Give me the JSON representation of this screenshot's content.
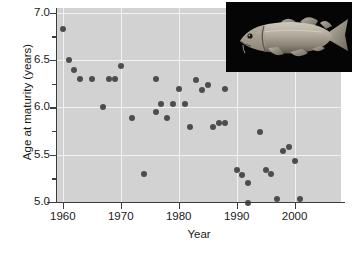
{
  "figure": {
    "background_color": "#ffffff",
    "panel_color": "#d2d2d2",
    "grid_color": "#f2f2f2",
    "marker_color": "#4d4d4d",
    "axis_color": "#3d3d3d"
  },
  "inset": {
    "name": "atlantic-cod-photograph",
    "background_color": "#050505",
    "subject": "cod-fish"
  },
  "chart_data": {
    "type": "scatter",
    "title": "",
    "xlabel": "Year",
    "ylabel": "Age at maturity (years)",
    "xlim": [
      1959,
      2008
    ],
    "ylim": [
      5.0,
      7.05
    ],
    "xticks": [
      1960,
      1970,
      1980,
      1990,
      2000
    ],
    "xticklabels": [
      "1960",
      "1970",
      "1980",
      "1990",
      "2000"
    ],
    "yticks": [
      5.0,
      5.5,
      6.0,
      6.5,
      7.0
    ],
    "yticklabels": [
      "5.0",
      "5.5",
      "6.0",
      "6.5",
      "7.0"
    ],
    "yminorticks": [
      5.25,
      5.75,
      6.25,
      6.75
    ],
    "grid": true,
    "grid_axis": "both",
    "legend": null,
    "series": [
      {
        "name": "Age at maturity",
        "marker": "circle",
        "color": "#4d4d4d",
        "points": [
          {
            "x": 1960,
            "y": 6.83
          },
          {
            "x": 1961,
            "y": 6.5
          },
          {
            "x": 1962,
            "y": 6.4
          },
          {
            "x": 1963,
            "y": 6.3
          },
          {
            "x": 1965,
            "y": 6.3
          },
          {
            "x": 1968,
            "y": 6.3
          },
          {
            "x": 1969,
            "y": 6.3
          },
          {
            "x": 1967,
            "y": 6.0
          },
          {
            "x": 1970,
            "y": 6.44
          },
          {
            "x": 1972,
            "y": 5.89
          },
          {
            "x": 1974,
            "y": 5.3
          },
          {
            "x": 1976,
            "y": 6.3
          },
          {
            "x": 1976,
            "y": 5.95
          },
          {
            "x": 1977,
            "y": 6.04
          },
          {
            "x": 1978,
            "y": 5.89
          },
          {
            "x": 1979,
            "y": 6.04
          },
          {
            "x": 1980,
            "y": 6.19
          },
          {
            "x": 1981,
            "y": 6.04
          },
          {
            "x": 1982,
            "y": 5.79
          },
          {
            "x": 1983,
            "y": 6.29
          },
          {
            "x": 1984,
            "y": 6.18
          },
          {
            "x": 1985,
            "y": 6.24
          },
          {
            "x": 1986,
            "y": 5.79
          },
          {
            "x": 1987,
            "y": 5.83
          },
          {
            "x": 1988,
            "y": 6.19
          },
          {
            "x": 1988,
            "y": 5.83
          },
          {
            "x": 1990,
            "y": 5.34
          },
          {
            "x": 1991,
            "y": 5.29
          },
          {
            "x": 1992,
            "y": 5.2
          },
          {
            "x": 1992,
            "y": 4.99
          },
          {
            "x": 1994,
            "y": 5.74
          },
          {
            "x": 1995,
            "y": 5.34
          },
          {
            "x": 1996,
            "y": 5.3
          },
          {
            "x": 1997,
            "y": 5.03
          },
          {
            "x": 1998,
            "y": 5.54
          },
          {
            "x": 1999,
            "y": 5.58
          },
          {
            "x": 2000,
            "y": 5.43
          },
          {
            "x": 2001,
            "y": 5.03
          }
        ]
      }
    ]
  }
}
